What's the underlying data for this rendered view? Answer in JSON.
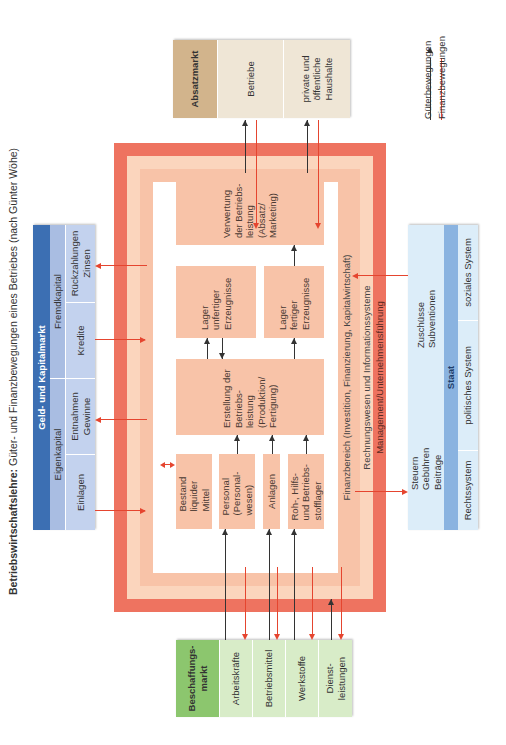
{
  "title": {
    "bold": "Betriebswirtschaftslehre:",
    "rest": " Güter- und Finanzbewegungen eines Betriebes (nach Günter Wöhe)"
  },
  "colors": {
    "frame_outer": "#ee7360",
    "frame_mid": "#fbd5bd",
    "frame_inner": "#f8c3a8",
    "goods_arrow": "#333333",
    "finance_arrow": "#e5452f",
    "absatz_header": "#d2b48c",
    "absatz_cell": "#efe6d6",
    "beschaffung_header": "#8cc66e",
    "beschaffung_cell": "#d8ecc8",
    "geld_header": "#3c6fb3",
    "geld_sub": "#a9bde2",
    "staat_header": "#8ab3e0",
    "staat_cell": "#dcedf9"
  },
  "frame": {
    "finanzbereich": "Finanzbereich (Investition, Finanzierung, Kapitalwirtschaft)",
    "rechnungswesen": "Rechnungswesen und Informationssysteme",
    "management": "Management/Unternehmensführung"
  },
  "inner_boxes": {
    "bestand": "Bestand liquider Mittel",
    "personal": "Personal (Personal-wesen)",
    "anlagen": "Anlagen",
    "roh": "Roh-, Hilfs- und Betriebs-stofflager",
    "erstellung": "Erstellung der Betriebs-leistung (Produktion/ Fertigung)",
    "lager_unfertig": "Lager unfertiger Erzeugnisse",
    "lager_fertig": "Lager fertiger Erzeugnisse",
    "verwertung": "Verwertung der Betriebs-leistung (Absatz/ Marketing)"
  },
  "absatzmarkt": {
    "header": "Absatzmarkt",
    "cells": [
      "Betriebe",
      "private und öffentliche Haushalte"
    ]
  },
  "beschaffungsmarkt": {
    "header": "Beschaffungs-markt",
    "cells": [
      "Arbeitskräfte",
      "Betriebsmittel",
      "Werkstoffe",
      "Dienst-leistungen"
    ]
  },
  "geldmarkt": {
    "header": "Geld- und Kapitalmarkt",
    "groups": [
      "Eigenkapital",
      "Fremdkapital"
    ],
    "cells": [
      "Einlagen",
      "Entnahmen Gewinne",
      "Kredite",
      "Rückzahlungen Zinsen"
    ]
  },
  "staat": {
    "header": "Staat",
    "cells": [
      "Steuern Gebühren Beiträge",
      "Zuschüsse Subventionen"
    ],
    "systems": [
      "Rechtssystem",
      "politisches System",
      "soziales System"
    ]
  },
  "legend": {
    "goods": "Güterbewegungen",
    "finance": "Finanzbewegungen"
  }
}
